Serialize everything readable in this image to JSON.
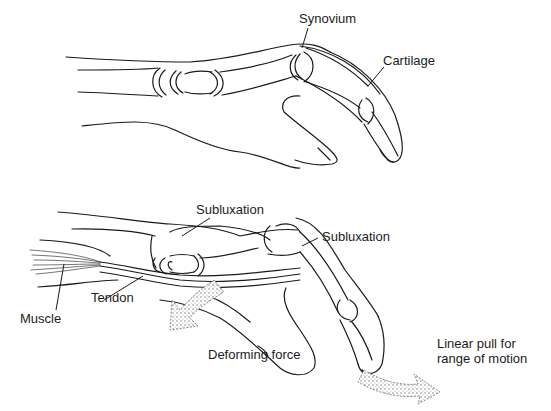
{
  "figure": {
    "top_panel": {
      "description": "Normal finger: longitudinal section of hand with joints",
      "labels": {
        "synovium": "Synovium",
        "cartilage": "Cartilage"
      }
    },
    "bottom_panel": {
      "description": "Deformed finger with subluxated joints and tendon pull",
      "labels": {
        "subluxation_1": "Subluxation",
        "subluxation_2": "Subluxation",
        "tendon": "Tendon",
        "muscle": "Muscle",
        "deforming_force": "Deforming force",
        "linear_pull_line1": "Linear pull for",
        "linear_pull_line2": "range of motion"
      }
    },
    "colors": {
      "line": "#1a1a1a",
      "arrow_fill": "#c8c8c8",
      "background": "#ffffff"
    }
  }
}
